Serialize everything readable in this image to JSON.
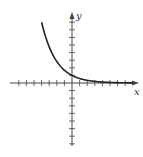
{
  "chart_data": {
    "type": "line",
    "title": "",
    "xlabel": "x",
    "ylabel": "y",
    "xlim": [
      -8,
      9
    ],
    "ylim": [
      -9,
      9
    ],
    "grid": false,
    "x_ticks_every": 1,
    "y_ticks_every": 1,
    "series": [
      {
        "name": "exponential decay",
        "x": [
          -4,
          -3,
          -2,
          -1,
          0,
          1,
          2,
          3,
          4,
          5,
          6,
          7,
          8
        ],
        "y": [
          8,
          4.76,
          2.83,
          1.68,
          1,
          0.59,
          0.35,
          0.21,
          0.13,
          0.07,
          0.04,
          0.03,
          0.02
        ]
      }
    ],
    "colors": {
      "axis": "#444444",
      "curve": "#222222"
    }
  },
  "labels": {
    "x_axis": "x",
    "y_axis": "y"
  }
}
